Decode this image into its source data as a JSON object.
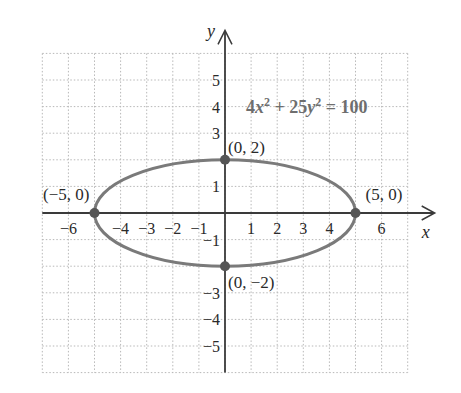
{
  "chart_data": {
    "type": "line",
    "title": "",
    "equation": {
      "parts": [
        "4",
        "x",
        "2",
        " + 25",
        "y",
        "2",
        " = 100"
      ],
      "text": "4x^2 + 25y^2 = 100"
    },
    "curve": {
      "kind": "ellipse",
      "center": [
        0,
        0
      ],
      "semi_major_x": 5,
      "semi_minor_y": 2,
      "color": "#7a7a7a"
    },
    "points": [
      {
        "x": -5,
        "y": 0,
        "label": "(−5, 0)"
      },
      {
        "x": 5,
        "y": 0,
        "label": "(5, 0)"
      },
      {
        "x": 0,
        "y": 2,
        "label": "(0, 2)"
      },
      {
        "x": 0,
        "y": -2,
        "label": "(0, −2)"
      }
    ],
    "xlabel": "x",
    "ylabel": "y",
    "xlim": [
      -7,
      7
    ],
    "ylim": [
      -6,
      6
    ],
    "grid": true,
    "grid_style": "dotted",
    "x_ticks": [
      {
        "value": -6,
        "label": "−6"
      },
      {
        "value": -4,
        "label": "−4"
      },
      {
        "value": -3,
        "label": "−3"
      },
      {
        "value": -2,
        "label": "−2"
      },
      {
        "value": -1,
        "label": "−1"
      },
      {
        "value": 1,
        "label": "1"
      },
      {
        "value": 2,
        "label": "2"
      },
      {
        "value": 3,
        "label": "3"
      },
      {
        "value": 4,
        "label": "4"
      },
      {
        "value": 6,
        "label": "6"
      }
    ],
    "y_ticks": [
      {
        "value": 5,
        "label": "5"
      },
      {
        "value": 4,
        "label": "4"
      },
      {
        "value": 3,
        "label": "3"
      },
      {
        "value": 1,
        "label": "1"
      },
      {
        "value": -1,
        "label": "−1"
      },
      {
        "value": -3,
        "label": "−3"
      },
      {
        "value": -4,
        "label": "−4"
      },
      {
        "value": -5,
        "label": "−5"
      }
    ],
    "colors": {
      "axis": "#3a3a3a",
      "grid": "#b8b8b8",
      "curve": "#7a7a7a",
      "point": "#555555",
      "equation": "#6e6e6e"
    }
  }
}
